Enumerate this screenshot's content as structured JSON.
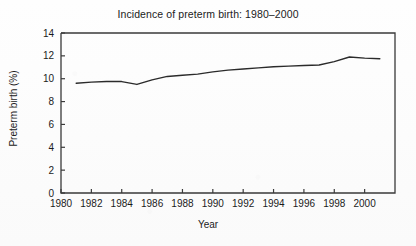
{
  "chart_data": {
    "type": "line",
    "title": "Incidence of preterm birth: 1980–2000",
    "xlabel": "Year",
    "ylabel": "Preterm birth (%)",
    "xlim": [
      1980,
      2002
    ],
    "ylim": [
      0,
      14
    ],
    "xticks": [
      1980,
      1982,
      1984,
      1986,
      1988,
      1990,
      1992,
      1994,
      1996,
      1998,
      2000
    ],
    "xtick_labels": [
      "1980",
      "1982",
      "1984",
      "1986",
      "1988",
      "1990",
      "1992",
      "1994",
      "1996",
      "1998",
      "2000"
    ],
    "yticks": [
      0,
      2,
      4,
      6,
      8,
      10,
      12,
      14
    ],
    "ytick_labels": [
      "0",
      "2",
      "4",
      "6",
      "8",
      "10",
      "12",
      "14"
    ],
    "grid": false,
    "legend": null,
    "line_color": "#2b2b2b",
    "line_width": 1.4,
    "x": [
      1981,
      1982,
      1983,
      1984,
      1985,
      1986,
      1987,
      1988,
      1989,
      1990,
      1991,
      1992,
      1993,
      1994,
      1995,
      1996,
      1997,
      1998,
      1999,
      2000,
      2001
    ],
    "values": [
      9.6,
      9.7,
      9.75,
      9.75,
      9.5,
      9.9,
      10.2,
      10.3,
      10.4,
      10.6,
      10.75,
      10.85,
      10.95,
      11.05,
      11.1,
      11.15,
      11.2,
      11.5,
      11.9,
      11.8,
      11.75
    ],
    "series": [
      {
        "name": "Preterm birth (%)",
        "values": [
          9.6,
          9.7,
          9.75,
          9.75,
          9.5,
          9.9,
          10.2,
          10.3,
          10.4,
          10.6,
          10.75,
          10.85,
          10.95,
          11.05,
          11.1,
          11.15,
          11.2,
          11.5,
          11.9,
          11.8,
          11.75
        ]
      }
    ]
  },
  "figure": {
    "background_color": "#fdfdfd",
    "axis_color": "#3a3a3a"
  }
}
